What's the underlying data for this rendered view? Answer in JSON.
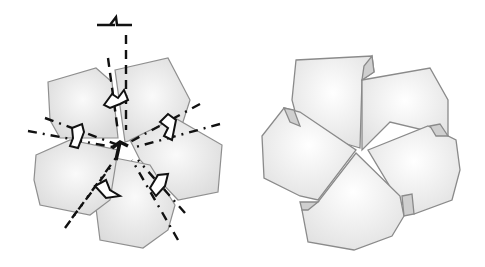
{
  "diagram": {
    "type": "folding-illustration",
    "panels": [
      {
        "id": "step-fold",
        "description": "Five-petal flower with dash-dot fold lines and curved arrows indicating twist folds"
      },
      {
        "id": "step-result",
        "description": "Resulting five-petal twisted flower shape"
      }
    ],
    "colors": {
      "petal_fill": "#e6e6e6",
      "petal_stroke": "#8a8a8a",
      "line": "#111111",
      "inner_fold": "#cfcfcf"
    }
  }
}
